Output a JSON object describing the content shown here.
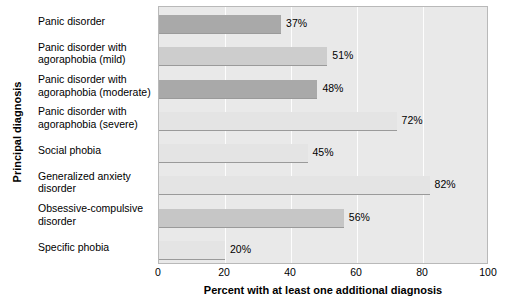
{
  "chart_data": {
    "type": "bar",
    "orientation": "horizontal",
    "title": "",
    "xlabel": "Percent with at least one additional diagnosis",
    "ylabel": "Principal diagnosis",
    "xlim": [
      0,
      100
    ],
    "xticks": [
      "0",
      "20",
      "40",
      "60",
      "80",
      "100"
    ],
    "xtick_values": [
      0,
      20,
      40,
      60,
      80,
      100
    ],
    "grid": "vertical-white-gridlines",
    "legend": "none",
    "categories": [
      "Panic disorder",
      "Panic disorder with agoraphobia (mild)",
      "Panic disorder with agoraphobia (moderate)",
      "Panic disorder with agoraphobia (severe)",
      "Social phobia",
      "Generalized anxiety disorder",
      "Obsessive-compulsive disorder",
      "Specific phobia"
    ],
    "category_lines": [
      [
        "Panic disorder"
      ],
      [
        "Panic disorder with",
        "agoraphobia (mild)"
      ],
      [
        "Panic disorder with",
        "agoraphobia (moderate)"
      ],
      [
        "Panic disorder with",
        "agoraphobia (severe)"
      ],
      [
        "Social phobia"
      ],
      [
        "Generalized anxiety",
        "disorder"
      ],
      [
        "Obsessive-compulsive",
        "disorder"
      ],
      [
        "Specific phobia"
      ]
    ],
    "values": [
      37,
      51,
      48,
      72,
      45,
      82,
      56,
      20
    ],
    "data_labels": [
      "37%",
      "51%",
      "48%",
      "72%",
      "45%",
      "82%",
      "56%",
      "20%"
    ],
    "bar_colors": [
      "#a9a9a9",
      "#cdcdcd",
      "#a9a9a9",
      "#e4e4e4",
      "#e4e4e4",
      "#e4e4e4",
      "#c6c6c6",
      "#e4e4e4"
    ],
    "plot_background": "#e9e9e9",
    "gridline_color": "#fdfdfd",
    "axis_border_color": "#b9b9b9",
    "text_color": "#000000"
  },
  "axis": {
    "y_title": "Principal diagnosis",
    "x_title": "Percent with at least one additional diagnosis"
  }
}
